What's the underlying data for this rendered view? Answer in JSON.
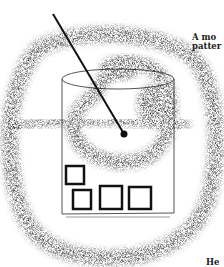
{
  "figure": {
    "caption_top_line1": "A mo",
    "caption_top_line2": "patter",
    "caption_bottom": "He",
    "elements": {
      "outer_loop": "stippled-loop",
      "inner_loop": "stippled-inner-loop",
      "container": "cylindrical-container",
      "pointer": "needle-pointer",
      "squares_count": 5
    },
    "colors": {
      "ink": "#111111",
      "paper": "#ffffff",
      "outline": "#555555"
    }
  }
}
